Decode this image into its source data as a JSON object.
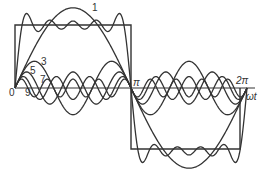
{
  "diagram": {
    "axis": {
      "x_label": "ωt",
      "origin_label": "0",
      "pi_label": "π",
      "two_pi_label": "2π"
    },
    "harmonic_labels": [
      "1",
      "3",
      "5",
      "7",
      "9"
    ],
    "colors": {
      "stroke": "#333333",
      "background": "#ffffff"
    }
  }
}
